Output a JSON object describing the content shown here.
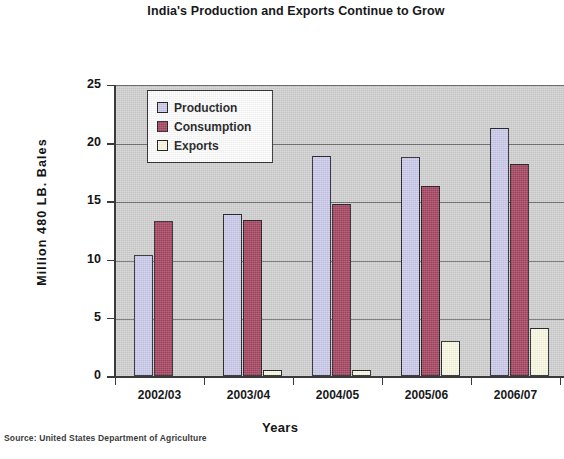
{
  "chart_data": {
    "type": "bar",
    "title": "India's Production and Exports Continue to Grow",
    "xlabel": "Years",
    "ylabel": "Million 480 LB. Bales",
    "categories": [
      "2002/03",
      "2003/04",
      "2004/05",
      "2005/06",
      "2006/07"
    ],
    "series": [
      {
        "name": "Production",
        "color": "#ccccec",
        "values": [
          10.4,
          13.9,
          18.9,
          18.8,
          21.3
        ]
      },
      {
        "name": "Consumption",
        "color": "#a64662",
        "values": [
          13.3,
          13.4,
          14.8,
          16.3,
          18.2
        ]
      },
      {
        "name": "Exports",
        "color": "#fbfbe4",
        "values": [
          0.0,
          0.5,
          0.5,
          3.0,
          4.1
        ]
      }
    ],
    "ylim": [
      0,
      25
    ],
    "yticks": [
      0,
      5,
      10,
      15,
      20,
      25
    ],
    "ytick_labels": [
      "0",
      "5",
      "10",
      "15",
      "20",
      "25"
    ],
    "grid": true,
    "legend_position": "top-left-inside",
    "plot_background": "#d2d2d2",
    "note": "Chart is cropped at the right edge; the 2006/07 Exports bar and plot border are partially cut off."
  },
  "source": {
    "label": "Source: United States Department of Agriculture"
  },
  "legend": {
    "items": [
      {
        "label": "Production"
      },
      {
        "label": "Consumption"
      },
      {
        "label": "Exports"
      }
    ]
  }
}
